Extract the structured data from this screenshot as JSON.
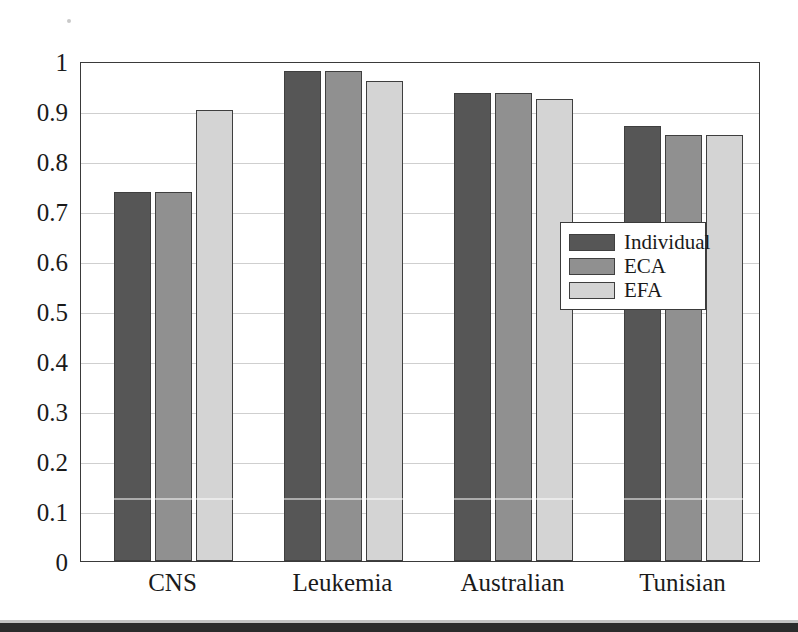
{
  "chart_data": {
    "type": "bar",
    "title": "",
    "subtitle": "",
    "xlabel": "",
    "ylabel": "",
    "categories": [
      "CNS",
      "Leukemia",
      "Australian",
      "Tunisian"
    ],
    "series": [
      {
        "name": "Individual",
        "color": "#565656",
        "values": [
          0.738,
          0.98,
          0.937,
          0.87
        ]
      },
      {
        "name": "ECA",
        "color": "#909090",
        "values": [
          0.738,
          0.98,
          0.937,
          0.852
        ]
      },
      {
        "name": "EFA",
        "color": "#d4d4d4",
        "values": [
          0.902,
          0.96,
          0.925,
          0.852
        ]
      }
    ],
    "ylim": [
      0,
      1
    ],
    "ytick_labels": [
      "0",
      "0.1",
      "0.2",
      "0.3",
      "0.4",
      "0.5",
      "0.6",
      "0.7",
      "0.8",
      "0.9",
      "1"
    ],
    "ytick_values": [
      0,
      0.1,
      0.2,
      0.3,
      0.4,
      0.5,
      0.6,
      0.7,
      0.8,
      0.9,
      1
    ],
    "grid": true,
    "grid_axis": "y",
    "legend_position": "lower-right-inside",
    "frame": true,
    "colors": {
      "axis": "#3a3a3a",
      "gridline": "#cfcfcf",
      "text": "#1a1a1a",
      "background": "#ffffff"
    }
  },
  "legend": {
    "entries": [
      {
        "label": "Individual"
      },
      {
        "label": "ECA"
      },
      {
        "label": "EFA"
      }
    ]
  }
}
